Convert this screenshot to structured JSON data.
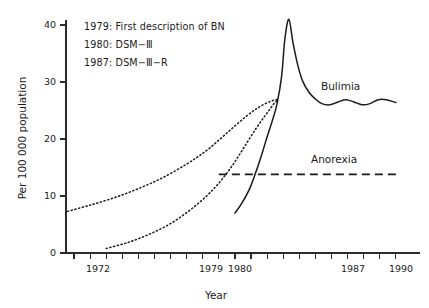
{
  "chart_data": {
    "type": "line",
    "title": "",
    "xlabel": "Year",
    "ylabel": "Per 100 000 population",
    "xlim": [
      1969.5,
      1991.5
    ],
    "ylim": [
      0,
      43
    ],
    "grid": false,
    "legend_position": "inline-labels",
    "x_ticks": [
      1970,
      1971,
      1972,
      1973,
      1974,
      1975,
      1976,
      1977,
      1978,
      1979,
      1980,
      1981,
      1982,
      1983,
      1984,
      1985,
      1986,
      1987,
      1988,
      1989,
      1990
    ],
    "x_tick_labels": [
      "1972",
      "1979",
      "1980",
      "1987",
      "1990"
    ],
    "x_tick_label_values": [
      1972,
      1979,
      1980,
      1987,
      1990
    ],
    "y_ticks": [
      0,
      10,
      20,
      30,
      40
    ],
    "y_tick_labels": [
      "0",
      "10",
      "20",
      "30",
      "40"
    ],
    "series": [
      {
        "name": "Bulimia",
        "style": "solid",
        "label": "Bulimia",
        "x": [
          1980.0,
          1980.4,
          1980.9,
          1981.3,
          1981.7,
          1982.0,
          1982.3,
          1982.6,
          1982.9,
          1983.1,
          1983.35,
          1983.6,
          1983.9,
          1984.2,
          1984.6,
          1985.0,
          1985.4,
          1985.9,
          1986.4,
          1986.9,
          1987.4,
          1987.9,
          1988.4,
          1988.9,
          1989.4,
          1990.0
        ],
        "y": [
          7.0,
          8.6,
          11.2,
          14.2,
          17.6,
          20.4,
          23.0,
          26.0,
          31.0,
          37.5,
          41.0,
          37.0,
          33.0,
          30.2,
          28.2,
          27.0,
          26.2,
          26.0,
          26.5,
          26.9,
          26.5,
          26.0,
          26.2,
          26.9,
          26.9,
          26.4
        ]
      },
      {
        "name": "Anorexia",
        "style": "dashed",
        "label": "Anorexia",
        "x": [
          1979.0,
          1990.0
        ],
        "y": [
          13.8,
          13.8
        ]
      },
      {
        "name": "Bulimia projection upper",
        "style": "dotted",
        "label": "",
        "x": [
          1969.6,
          1971.0,
          1972.5,
          1974.0,
          1975.5,
          1977.0,
          1978.2,
          1979.2,
          1980.0,
          1980.8,
          1981.5,
          1982.2,
          1982.7
        ],
        "y": [
          7.3,
          8.4,
          9.7,
          11.3,
          13.2,
          15.6,
          17.9,
          20.3,
          22.3,
          24.2,
          25.6,
          26.6,
          27.0
        ]
      },
      {
        "name": "Bulimia projection lower",
        "style": "dotted",
        "label": "",
        "x": [
          1972.0,
          1973.3,
          1974.6,
          1975.9,
          1977.1,
          1978.2,
          1979.1,
          1979.9,
          1980.6,
          1981.3,
          1981.9,
          1982.4,
          1982.7
        ],
        "y": [
          0.8,
          1.8,
          3.2,
          5.0,
          7.3,
          9.9,
          12.6,
          15.6,
          18.7,
          21.8,
          24.2,
          26.1,
          27.0
        ]
      }
    ],
    "annotations": [
      {
        "text": "1979: First description of BN"
      },
      {
        "text": "1980: DSM−Ⅲ"
      },
      {
        "text": "1987: DSM−Ⅲ−R"
      }
    ]
  }
}
